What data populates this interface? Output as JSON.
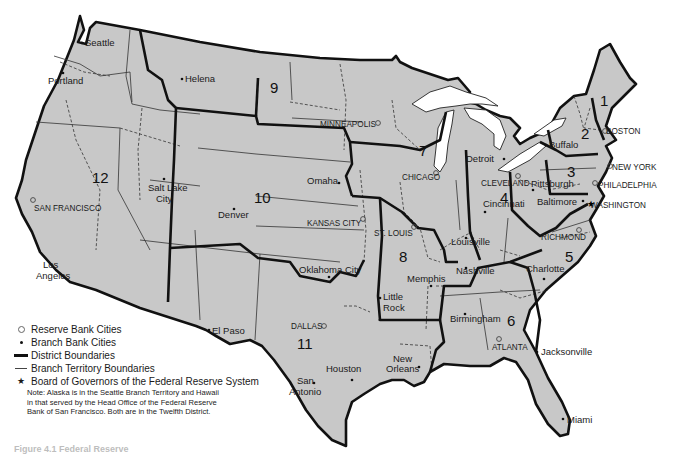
{
  "map": {
    "title": "Federal Reserve System",
    "colors": {
      "land": "#c8c8c8",
      "boundary": "#111111",
      "background": "#ffffff"
    },
    "districts": [
      {
        "number": "1",
        "x": 548,
        "y": 102
      },
      {
        "number": "2",
        "x": 581,
        "y": 136
      },
      {
        "number": "3",
        "x": 567,
        "y": 177
      },
      {
        "number": "4",
        "x": 500,
        "y": 199
      },
      {
        "number": "5",
        "x": 566,
        "y": 261
      },
      {
        "number": "6",
        "x": 509,
        "y": 384
      },
      {
        "number": "7",
        "x": 420,
        "y": 152
      },
      {
        "number": "8",
        "x": 404,
        "y": 259
      },
      {
        "number": "9",
        "x": 270,
        "y": 90
      },
      {
        "number": "10",
        "x": 256,
        "y": 197
      },
      {
        "number": "11",
        "x": 302,
        "y": 346
      },
      {
        "number": "12",
        "x": 98,
        "y": 178
      }
    ],
    "reserve_bank_cities": [
      {
        "name": "BOSTON",
        "x": 603,
        "y": 131,
        "lx": 609,
        "ly": 134
      },
      {
        "name": "NEW YORK",
        "x": 610,
        "y": 166,
        "lx": 612,
        "ly": 167
      },
      {
        "name": "PHILADELPHIA",
        "x": 595,
        "y": 183,
        "lx": 599,
        "ly": 185
      },
      {
        "name": "CLEVELAND",
        "x": 517,
        "y": 176,
        "lx": 481,
        "ly": 187
      },
      {
        "name": "RICHMOND",
        "x": 579,
        "y": 230,
        "lx": 541,
        "ly": 239
      },
      {
        "name": "ATLANTA",
        "x": 499,
        "y": 342,
        "lx": 492,
        "ly": 352
      },
      {
        "name": "CHICAGO",
        "x": 436,
        "y": 172,
        "lx": 403,
        "ly": 180
      },
      {
        "name": "ST. LOUIS",
        "x": 415,
        "y": 226,
        "lx": 374,
        "ly": 236
      },
      {
        "name": "MINNEAPOLIS",
        "x": 408,
        "y": 123,
        "lx": 320,
        "ly": 127
      },
      {
        "name": "KANSAS CITY",
        "x": 363,
        "y": 220,
        "lx": 307,
        "ly": 226
      },
      {
        "name": "DALLAS",
        "x": 324,
        "y": 326,
        "lx": 290,
        "ly": 329
      },
      {
        "name": "SAN FRANCISCO",
        "x": 33,
        "y": 200,
        "lx": 34,
        "ly": 211
      },
      {
        "name": "WASHINGTON",
        "x": 588,
        "y": 204,
        "lx": 590,
        "ly": 208
      }
    ],
    "branch_bank_cities": [
      {
        "name": "Seattle",
        "x": 81,
        "y": 42,
        "lx": 85,
        "ly": 46
      },
      {
        "name": "Portland",
        "x": 63,
        "y": 72,
        "lx": 48,
        "ly": 85
      },
      {
        "name": "Helena",
        "x": 181,
        "y": 78,
        "lx": 185,
        "ly": 82
      },
      {
        "name": "Salt Lake",
        "x": 163,
        "y": 178,
        "lx": 147,
        "ly": 191
      },
      {
        "name": "City",
        "x": 0,
        "y": 0,
        "lx": 155,
        "ly": 202
      },
      {
        "name": "Denver",
        "x": 234,
        "y": 209,
        "lx": 218,
        "ly": 218
      },
      {
        "name": "Omaha",
        "x": 338,
        "y": 181,
        "lx": 305,
        "ly": 184
      },
      {
        "name": "Oklahoma City",
        "x": 327,
        "y": 277,
        "lx": 298,
        "ly": 274
      },
      {
        "name": "El Paso",
        "x": 209,
        "y": 330,
        "lx": 212,
        "ly": 334
      },
      {
        "name": "San",
        "x": 0,
        "y": 0,
        "lx": 299,
        "ly": 385
      },
      {
        "name": "Antonio",
        "x": 314,
        "y": 384,
        "lx": 288,
        "ly": 396
      },
      {
        "name": "Houston",
        "x": 353,
        "y": 378,
        "lx": 326,
        "ly": 372
      },
      {
        "name": "New",
        "x": 0,
        "y": 0,
        "lx": 393,
        "ly": 362
      },
      {
        "name": "Orleans",
        "x": 419,
        "y": 367,
        "lx": 385,
        "ly": 373
      },
      {
        "name": "Little",
        "x": 380,
        "y": 298,
        "lx": 383,
        "ly": 301
      },
      {
        "name": "Rock",
        "x": 0,
        "y": 0,
        "lx": 383,
        "ly": 311
      },
      {
        "name": "Memphis",
        "x": 431,
        "y": 285,
        "lx": 407,
        "ly": 281
      },
      {
        "name": "Nashville",
        "x": 467,
        "y": 266,
        "lx": 456,
        "ly": 274
      },
      {
        "name": "Birmingham",
        "x": 465,
        "y": 314,
        "lx": 450,
        "ly": 322
      },
      {
        "name": "Louisville",
        "x": 465,
        "y": 240,
        "lx": 451,
        "ly": 245
      },
      {
        "name": "Cincinnati",
        "x": 485,
        "y": 212,
        "lx": 482,
        "ly": 207
      },
      {
        "name": "Detroit",
        "x": 504,
        "y": 159,
        "lx": 466,
        "ly": 161
      },
      {
        "name": "Pittsburgh",
        "x": 532,
        "y": 190,
        "lx": 531,
        "ly": 187
      },
      {
        "name": "Baltimore",
        "x": 583,
        "y": 203,
        "lx": 537,
        "ly": 205
      },
      {
        "name": "Buffalo",
        "x": 545,
        "y": 144,
        "lx": 549,
        "ly": 148
      },
      {
        "name": "Charlotte",
        "x": 545,
        "y": 279,
        "lx": 526,
        "ly": 272
      },
      {
        "name": "Jacksonville",
        "x": 537,
        "y": 351,
        "lx": 541,
        "ly": 355
      },
      {
        "name": "Miami",
        "x": 563,
        "y": 419,
        "lx": 567,
        "ly": 423
      },
      {
        "name": "Los",
        "x": 0,
        "y": 0,
        "lx": 43,
        "ly": 268
      },
      {
        "name": "Angeles",
        "x": 0,
        "y": 0,
        "lx": 36,
        "ly": 279
      }
    ]
  },
  "legend": {
    "items": [
      {
        "symbol": "ring",
        "label": "Reserve Bank Cities"
      },
      {
        "symbol": "dot",
        "label": "Branch Bank Cities"
      },
      {
        "symbol": "thick-line",
        "label": "District Boundaries"
      },
      {
        "symbol": "thin-line",
        "label": "Branch Territory Boundaries"
      },
      {
        "symbol": "star",
        "label": "Board of Governors of the Federal Reserve System"
      }
    ],
    "note": "Note: Alaska is in the Seattle Branch Territory and Hawaii in that served by the Head Office of the Federal Reserve Bank of San Francisco. Both are in the Twelfth District."
  },
  "caption": "Figure 4.1   Federal Reserve"
}
